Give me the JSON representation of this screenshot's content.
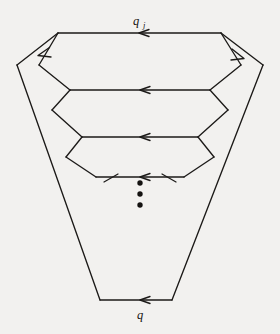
{
  "figure": {
    "background_color": "#f2f1ef",
    "stroke_color": "#1c1a18",
    "labels": {
      "top": {
        "base": "q",
        "subscript": "j",
        "full": "q_j",
        "x": 139,
        "y": 22
      },
      "bottom": {
        "base": "q",
        "subscript": "",
        "full": "q",
        "x": 139,
        "y": 317
      }
    },
    "ellipsis": {
      "name": "vertical-ellipsis",
      "dots": 3,
      "cx": 140,
      "cy": [
        183,
        194,
        205
      ],
      "radius": 2.6
    },
    "outer_trapezoid": {
      "name": "outer-boundary",
      "points": "140,33 58,33 17,65 100,300 172,300 263,65 140,33",
      "description": "outermost wedge shaped cycle"
    },
    "layers": [
      {
        "index": 0,
        "name": "layer-outer",
        "top_y": 33,
        "top_left_x": 58,
        "top_right_x": 221,
        "mid_y": 65,
        "mid_left_x": 17,
        "mid_right_x": 263,
        "arrow_on_top": true
      },
      {
        "index": 1,
        "name": "layer-2",
        "top_y": 33,
        "top_left_x": 58,
        "top_right_x": 221,
        "mid_y": 65,
        "mid_left_x": 39,
        "mid_right_x": 241,
        "bottom_y": 90,
        "bottom_left_x": 70,
        "bottom_right_x": 210,
        "arrow_on_top": true
      },
      {
        "index": 2,
        "name": "layer-3",
        "top_y": 90,
        "top_left_x": 70,
        "top_right_x": 210,
        "mid_y": 110,
        "mid_left_x": 52,
        "mid_right_x": 228,
        "bottom_y": 137,
        "bottom_left_x": 82,
        "bottom_right_x": 198,
        "arrow_on_top": true
      },
      {
        "index": 3,
        "name": "layer-4",
        "top_y": 137,
        "top_left_x": 82,
        "top_right_x": 198,
        "mid_y": 157,
        "mid_left_x": 66,
        "mid_right_x": 214,
        "bottom_y": 177,
        "bottom_left_x": 96,
        "bottom_right_x": 184,
        "arrow_on_top": true
      }
    ],
    "stubs": [
      {
        "name": "stub-left",
        "from_x": 104,
        "from_y": 181,
        "to_x": 118,
        "to_y": 173
      },
      {
        "name": "stub-right",
        "from_x": 176,
        "from_y": 181,
        "to_x": 162,
        "to_y": 173
      }
    ],
    "arrows": [
      {
        "name": "arrow-top-edge",
        "x": 144,
        "y": 33,
        "direction": "left"
      },
      {
        "name": "arrow-outer-left",
        "x": 44,
        "y": 56,
        "direction": "down-left"
      },
      {
        "name": "arrow-outer-right",
        "x": 239,
        "y": 58,
        "direction": "down-right"
      },
      {
        "name": "arrow-layer2-edge",
        "x": 144,
        "y": 90,
        "direction": "left"
      },
      {
        "name": "arrow-layer3-edge",
        "x": 144,
        "y": 137,
        "direction": "left"
      },
      {
        "name": "arrow-layer4-edge",
        "x": 144,
        "y": 177,
        "direction": "left"
      },
      {
        "name": "arrow-bottom-edge",
        "x": 144,
        "y": 300,
        "direction": "left"
      }
    ]
  }
}
